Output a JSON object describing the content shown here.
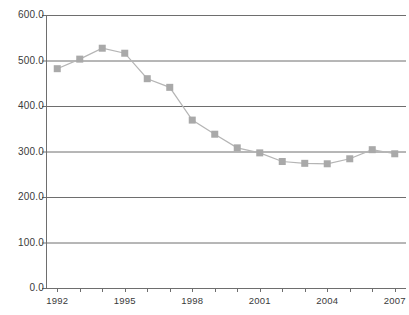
{
  "chart_data": {
    "type": "line",
    "title": "",
    "subtitle": "",
    "xlabel": "",
    "ylabel": "",
    "grid": true,
    "legend": false,
    "legend_position": "none",
    "xlim": [
      1991.5,
      2007.5
    ],
    "ylim": [
      0.0,
      600.0
    ],
    "x": [
      1992,
      1993,
      1994,
      1995,
      1996,
      1997,
      1998,
      1999,
      2000,
      2001,
      2002,
      2003,
      2004,
      2005,
      2006,
      2007
    ],
    "values": [
      482,
      503,
      527,
      516,
      460,
      441,
      369,
      338,
      308,
      297,
      278,
      274,
      273,
      284,
      304,
      295
    ],
    "categories": [
      "1992",
      "1993",
      "1994",
      "1995",
      "1996",
      "1997",
      "1998",
      "1999",
      "2000",
      "2001",
      "2002",
      "2003",
      "2004",
      "2005",
      "2006",
      "2007"
    ],
    "x_tick_labels": [
      "1992",
      "1995",
      "1998",
      "2001",
      "2004",
      "2007"
    ],
    "x_tick_values": [
      1992,
      1995,
      1998,
      2001,
      2004,
      2007
    ],
    "y_tick_labels": [
      "0.0",
      "100.0",
      "200.0",
      "300.0",
      "400.0",
      "500.0",
      "600.0"
    ],
    "y_tick_values": [
      0,
      100,
      200,
      300,
      400,
      500,
      600
    ],
    "series_name": "",
    "marker": "square",
    "colors": {
      "marker": "#a9a9a9",
      "line": "#b5b5b5",
      "gridline": "#6e6e6e",
      "axis": "#6e6e6e",
      "tick_label": "#3a3a3a",
      "background": "#ffffff"
    }
  }
}
